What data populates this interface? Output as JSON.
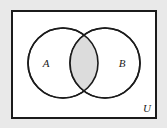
{
  "figure": {
    "type": "venn-diagram",
    "background_color": "#e9e9e9",
    "universe": {
      "label": "U",
      "fill_color": "#ffffff",
      "border_color": "#1b1b1b",
      "border_width": 2,
      "x": 11,
      "y": 10,
      "width": 146,
      "height": 109
    },
    "sets": [
      {
        "label": "A",
        "cx": 63,
        "cy": 63,
        "r": 35,
        "label_x": 46,
        "label_y": 67,
        "stroke_color": "#1b1b1b",
        "fill_color": "#ffffff"
      },
      {
        "label": "B",
        "cx": 105,
        "cy": 63,
        "r": 35,
        "label_x": 122,
        "label_y": 67,
        "stroke_color": "#1b1b1b",
        "fill_color": "#ffffff"
      }
    ],
    "intersection": {
      "name": "A-intersect-B",
      "shaded": true,
      "fill_color": "#dcdcdc"
    },
    "universe_label_x": 147,
    "universe_label_y": 112
  }
}
